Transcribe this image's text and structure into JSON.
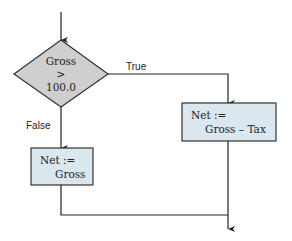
{
  "flowchart": {
    "decision": {
      "line1": "Gross",
      "line2": ">",
      "line3": "100.0",
      "fill": "#cfcfcf"
    },
    "true_label": "True",
    "false_label": "False",
    "true_box": {
      "line1": "Net :=",
      "line2": "Gross – Tax",
      "fill": "#dbe7ee"
    },
    "false_box": {
      "line1": "Net :=",
      "line2": "Gross",
      "fill": "#dbe7ee"
    }
  }
}
